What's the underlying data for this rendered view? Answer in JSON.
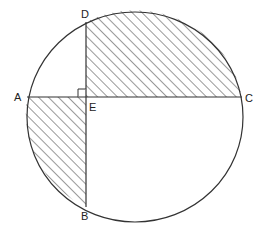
{
  "diagram": {
    "type": "circle-with-perpendicular-chords",
    "colors": {
      "stroke": "#333333",
      "hatch": "#444444",
      "background": "#ffffff"
    },
    "circle": {
      "cx": 135,
      "cy": 117,
      "rx": 108,
      "ry": 105
    },
    "points": {
      "A": {
        "label": "A",
        "x": 27,
        "y": 97
      },
      "C": {
        "label": "C",
        "x": 242,
        "y": 97
      },
      "D": {
        "label": "D",
        "x": 86,
        "y": 22
      },
      "B": {
        "label": "B",
        "x": 86,
        "y": 207
      },
      "E": {
        "label": "E",
        "x": 86,
        "y": 97
      }
    },
    "chords": [
      {
        "name": "AC",
        "from": "A",
        "to": "C"
      },
      {
        "name": "DB",
        "from": "D",
        "to": "B"
      }
    ],
    "right_angle_at": "E",
    "shaded_regions": [
      {
        "name": "region-DEC",
        "description": "Region bounded by ED, EC and arc DC"
      },
      {
        "name": "region-AEB",
        "description": "Region bounded by EA, EB and arc AB"
      }
    ]
  }
}
